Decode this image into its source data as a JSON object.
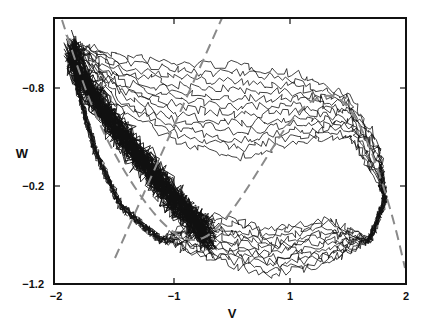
{
  "chart_data": {
    "type": "line",
    "title": "",
    "xlabel": "V",
    "ylabel": "W",
    "xlim": [
      -2,
      2
    ],
    "ylim_labels_as_shown": [
      "-0.8",
      "-0.2",
      "-1.2"
    ],
    "x_ticks": [
      {
        "label": "-2",
        "px": 56
      },
      {
        "label": "-1",
        "px": 174
      },
      {
        "label": "1",
        "px": 290
      },
      {
        "label": "2",
        "px": 406
      }
    ],
    "y_ticks": [
      {
        "label": "-0.8",
        "py": 88
      },
      {
        "label": "-0.2",
        "py": 186
      },
      {
        "label": "-1.2",
        "py": 284
      }
    ],
    "grid": false,
    "legend": null,
    "series": [
      {
        "name": "v-nullcline (cubic, dashed)",
        "style": "dashed",
        "color": "#8a8a8a",
        "points_px": [
          [
            62,
            20
          ],
          [
            75,
            60
          ],
          [
            95,
            115
          ],
          [
            120,
            165
          ],
          [
            150,
            210
          ],
          [
            175,
            235
          ],
          [
            195,
            242
          ],
          [
            215,
            232
          ],
          [
            240,
            200
          ],
          [
            265,
            160
          ],
          [
            290,
            120
          ],
          [
            315,
            97
          ],
          [
            335,
            95
          ],
          [
            350,
            108
          ],
          [
            365,
            135
          ],
          [
            380,
            175
          ],
          [
            395,
            225
          ],
          [
            405,
            268
          ]
        ]
      },
      {
        "name": "w-nullcline (linear, dashed)",
        "style": "dashed",
        "color": "#8a8a8a",
        "points_px": [
          [
            115,
            258
          ],
          [
            222,
            18
          ]
        ]
      },
      {
        "name": "stochastic trajectories",
        "style": "solid",
        "color": "#111111",
        "description": "Many noisy sample paths circulating clockwise around the limit cycle; densest along the left branch from (-1.9,top) down to bottom-left near V=-1"
      }
    ]
  },
  "colors": {
    "background": "#ffffff",
    "axes": "#111111",
    "nullcline": "#8a8a8a",
    "trajectory": "#111111"
  }
}
